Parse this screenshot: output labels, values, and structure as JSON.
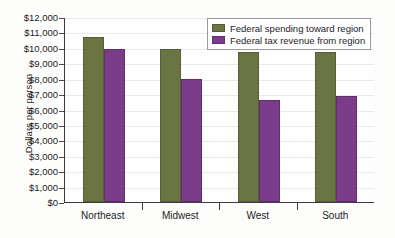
{
  "chart_data": {
    "type": "bar",
    "title": "",
    "xlabel": "",
    "ylabel": "Dollars per person",
    "ylim": [
      0,
      12000
    ],
    "ytick_step": 1000,
    "grid": true,
    "legend_position": "top-right",
    "categories": [
      "Northeast",
      "Midwest",
      "West",
      "South"
    ],
    "ytick_labels": [
      "$12,000",
      "$11,000",
      "$10,000",
      "$9,000",
      "$8,000",
      "$7,000",
      "$6,000",
      "$5,000",
      "$4,000",
      "$3,000",
      "$2,000",
      "$1,000",
      "$0"
    ],
    "ytick_values": [
      12000,
      11000,
      10000,
      9000,
      8000,
      7000,
      6000,
      5000,
      4000,
      3000,
      2000,
      1000,
      0
    ],
    "series": [
      {
        "name": "Federal spending toward region",
        "color": "#6b7543",
        "values": [
          10700,
          9900,
          9750,
          9750
        ]
      },
      {
        "name": "Federal tax revenue from region",
        "color": "#7b3d8a",
        "values": [
          9950,
          7950,
          6600,
          6850
        ]
      }
    ]
  },
  "legend": {
    "items": [
      {
        "label": "Federal spending toward region"
      },
      {
        "label": "Federal tax revenue from region"
      }
    ]
  },
  "colors": {
    "spending": "#6b7543",
    "revenue": "#7b3d8a",
    "axis": "#3b3b3b",
    "grid": "#e9e9ea",
    "background": "#fdfdfc"
  }
}
